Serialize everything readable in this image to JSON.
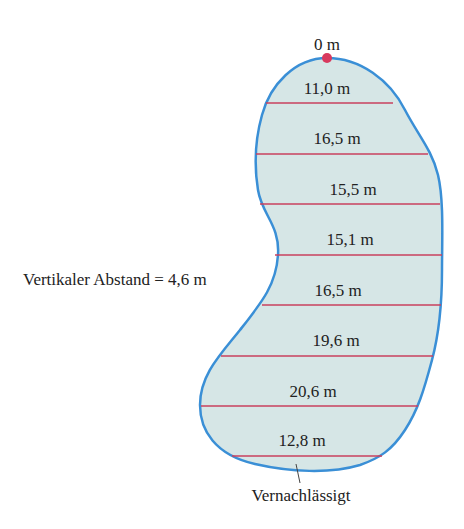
{
  "diagram": {
    "top_label": "0 m",
    "vertical_spacing_label": "Vertikaler Abstand = 4,6 m",
    "neglected_label": "Vernachlässigt",
    "widths": [
      {
        "label": "11,0 m",
        "x": 327,
        "y": 70
      },
      {
        "label": "16,5 m",
        "x": 337,
        "y": 121
      },
      {
        "label": "15,5 m",
        "x": 353,
        "y": 172
      },
      {
        "label": "15,1 m",
        "x": 350,
        "y": 222
      },
      {
        "label": "16,5 m",
        "x": 338,
        "y": 273
      },
      {
        "label": "19,6 m",
        "x": 336,
        "y": 323
      },
      {
        "label": "20,6 m",
        "x": 313,
        "y": 374
      },
      {
        "label": "12,8 m",
        "x": 302,
        "y": 424
      }
    ],
    "colors": {
      "outline": "#3a8fd6",
      "fill": "#d6e6e6",
      "chord": "#c8405e",
      "top_point": "#d83a5e"
    }
  }
}
